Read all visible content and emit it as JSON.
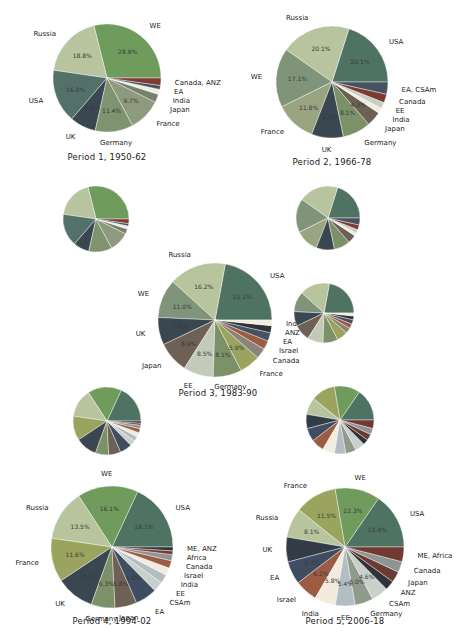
{
  "figure": {
    "background": "#ffffff"
  },
  "chart_data": [
    {
      "id": "p1",
      "type": "pie",
      "title": "Period 1, 1950-62",
      "show_labels": true,
      "slices": [
        {
          "name": "WE",
          "value": 28.9,
          "pct": "28.9%",
          "color": "#6f9b5d"
        },
        {
          "name": "Russia",
          "value": 18.8,
          "pct": "18.8%",
          "color": "#b7c49d"
        },
        {
          "name": "USA",
          "value": 16.0,
          "pct": "16.0%",
          "color": "#537069"
        },
        {
          "name": "UK",
          "value": 7.8,
          "pct": "7.8%",
          "color": "#3a4750"
        },
        {
          "name": "Germany",
          "value": 11.4,
          "pct": "11.4%",
          "color": "#7f9370"
        },
        {
          "name": "France",
          "value": 9.7,
          "pct": "9.7%",
          "color": "#8d9a7e"
        },
        {
          "name": "Japan",
          "value": 2.5,
          "pct": null,
          "color": "#77806d"
        },
        {
          "name": "India",
          "value": 1.5,
          "pct": null,
          "color": "#f1ecdd"
        },
        {
          "name": "EA",
          "value": 1.2,
          "pct": null,
          "color": "#46525f"
        },
        {
          "name": "Canada, ANZ",
          "value": 2.2,
          "pct": null,
          "color": "#7d3a33"
        }
      ]
    },
    {
      "id": "p2",
      "type": "pie",
      "title": "Period 2, 1966-78",
      "show_labels": true,
      "slices": [
        {
          "name": "USA",
          "value": 20.1,
          "pct": "20.1%",
          "color": "#4e7362"
        },
        {
          "name": "Russia",
          "value": 20.1,
          "pct": "20.1%",
          "color": "#b7c49d"
        },
        {
          "name": "WE",
          "value": 17.1,
          "pct": "17.1%",
          "color": "#7f9478"
        },
        {
          "name": "France",
          "value": 11.8,
          "pct": "11.8%",
          "color": "#9aa481"
        },
        {
          "name": "UK",
          "value": 9.2,
          "pct": "9.2%",
          "color": "#3a4750"
        },
        {
          "name": "Germany",
          "value": 8.1,
          "pct": "8.1%",
          "color": "#7d9168"
        },
        {
          "name": "Japan",
          "value": 4.3,
          "pct": "4.3%",
          "color": "#6d6054"
        },
        {
          "name": "India",
          "value": 1.5,
          "pct": null,
          "color": "#f1ecdd"
        },
        {
          "name": "EE",
          "value": 1.8,
          "pct": null,
          "color": "#c6cdc2"
        },
        {
          "name": "Canada",
          "value": 2.5,
          "pct": null,
          "color": "#7d3a33"
        },
        {
          "name": "EA, CSAm",
          "value": 3.5,
          "pct": null,
          "color": "#46525f"
        }
      ]
    },
    {
      "id": "p3",
      "type": "pie",
      "title": "Period 3, 1983-90",
      "show_labels": true,
      "slices": [
        {
          "name": "USA",
          "value": 22.1,
          "pct": "22.1%",
          "color": "#4e7362"
        },
        {
          "name": "Russia",
          "value": 16.2,
          "pct": "16.2%",
          "color": "#b7c49d"
        },
        {
          "name": "WE",
          "value": 11.0,
          "pct": "11.0%",
          "color": "#7f9478"
        },
        {
          "name": "UK",
          "value": 7.8,
          "pct": "7.8%",
          "color": "#3a4750"
        },
        {
          "name": "Japan",
          "value": 8.9,
          "pct": "8.9%",
          "color": "#6d6054"
        },
        {
          "name": "EE",
          "value": 8.5,
          "pct": "8.5%",
          "color": "#c3cab8"
        },
        {
          "name": "Germany",
          "value": 8.1,
          "pct": "8.1%",
          "color": "#7d9168"
        },
        {
          "name": "France",
          "value": 5.9,
          "pct": "5.9%",
          "color": "#9aa45f"
        },
        {
          "name": "Canada",
          "value": 3.0,
          "pct": null,
          "color": "#8a8578"
        },
        {
          "name": "Israel",
          "value": 2.5,
          "pct": null,
          "color": "#9c5b43"
        },
        {
          "name": "EA",
          "value": 2.4,
          "pct": null,
          "color": "#46525f"
        },
        {
          "name": "ANZ",
          "value": 2.0,
          "pct": null,
          "color": "#2f3338"
        },
        {
          "name": "India",
          "value": 1.6,
          "pct": null,
          "color": "#f1ecdd"
        }
      ]
    },
    {
      "id": "p4",
      "type": "pie",
      "title": "Period 4, 1994-02",
      "show_labels": true,
      "slices": [
        {
          "name": "USA",
          "value": 18.1,
          "pct": "18.1%",
          "color": "#4e7362"
        },
        {
          "name": "WE",
          "value": 16.1,
          "pct": "16.1%",
          "color": "#6f9b5d"
        },
        {
          "name": "Russia",
          "value": 13.5,
          "pct": "13.5%",
          "color": "#b7c49d"
        },
        {
          "name": "France",
          "value": 11.6,
          "pct": "11.6%",
          "color": "#9aa45f"
        },
        {
          "name": "UK",
          "value": 10.2,
          "pct": "10.2%",
          "color": "#3a4750"
        },
        {
          "name": "Germany",
          "value": 6.3,
          "pct": "6.3%",
          "color": "#7d9168"
        },
        {
          "name": "Japan",
          "value": 5.8,
          "pct": "5.8%",
          "color": "#6d6054"
        },
        {
          "name": "EA",
          "value": 5.8,
          "pct": "5.8%",
          "color": "#3f4d63"
        },
        {
          "name": "CSAm",
          "value": 2.6,
          "pct": null,
          "color": "#c9cfc9"
        },
        {
          "name": "EE",
          "value": 2.4,
          "pct": null,
          "color": "#b3bec4"
        },
        {
          "name": "India",
          "value": 2.0,
          "pct": null,
          "color": "#f1ecdd"
        },
        {
          "name": "Israel",
          "value": 2.0,
          "pct": null,
          "color": "#9c5b43"
        },
        {
          "name": "Canada",
          "value": 1.6,
          "pct": null,
          "color": "#8f9494"
        },
        {
          "name": "Africa",
          "value": 1.0,
          "pct": null,
          "color": "#7d3a33"
        },
        {
          "name": "ME, ANZ",
          "value": 1.0,
          "pct": null,
          "color": "#2f3338"
        }
      ]
    },
    {
      "id": "p5",
      "type": "pie",
      "title": "Period 5, 2006-18",
      "show_labels": true,
      "slices": [
        {
          "name": "USA",
          "value": 15.4,
          "pct": "15.4%",
          "color": "#4e7362"
        },
        {
          "name": "WE",
          "value": 12.3,
          "pct": "12.3%",
          "color": "#6f9b5d"
        },
        {
          "name": "France",
          "value": 11.5,
          "pct": "11.5%",
          "color": "#9aa45f"
        },
        {
          "name": "Russia",
          "value": 8.1,
          "pct": "8.1%",
          "color": "#b7c49d"
        },
        {
          "name": "UK",
          "value": 6.8,
          "pct": "6.8%",
          "color": "#323c46"
        },
        {
          "name": "EA",
          "value": 6.3,
          "pct": "6.3%",
          "color": "#3f4d63"
        },
        {
          "name": "Israel",
          "value": 6.2,
          "pct": "6.2%",
          "color": "#9c5b43"
        },
        {
          "name": "India",
          "value": 5.8,
          "pct": "5.8%",
          "color": "#f1ecdd"
        },
        {
          "name": "EE",
          "value": 5.4,
          "pct": "5.4%",
          "color": "#b3bec4"
        },
        {
          "name": "Germany",
          "value": 5.0,
          "pct": "5.0%",
          "color": "#8f9a8a"
        },
        {
          "name": "CSAm",
          "value": 4.6,
          "pct": "4.6%",
          "color": "#c9cfc9"
        },
        {
          "name": "ANZ",
          "value": 2.6,
          "pct": null,
          "color": "#2f3338"
        },
        {
          "name": "Japan",
          "value": 3.0,
          "pct": null,
          "color": "#6b3a33"
        },
        {
          "name": "Canada",
          "value": 3.0,
          "pct": null,
          "color": "#8f9494"
        },
        {
          "name": "ME, Africa",
          "value": 4.0,
          "pct": null,
          "color": "#703a33"
        }
      ]
    },
    {
      "id": "s1",
      "type": "pie",
      "title": "",
      "show_labels": false,
      "slices_from": "p1"
    },
    {
      "id": "s2",
      "type": "pie",
      "title": "",
      "show_labels": false,
      "slices_from": "p2"
    },
    {
      "id": "s3",
      "type": "pie",
      "title": "",
      "show_labels": false,
      "slices_from": "p3"
    },
    {
      "id": "s4",
      "type": "pie",
      "title": "",
      "show_labels": false,
      "slices_from": "p4"
    },
    {
      "id": "s5",
      "type": "pie",
      "title": "",
      "show_labels": false,
      "slices_from": "p5"
    }
  ]
}
